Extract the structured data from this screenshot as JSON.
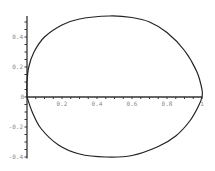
{
  "chart_data": {
    "type": "line",
    "title": "",
    "xlabel": "",
    "ylabel": "",
    "xlim": [
      0,
      1
    ],
    "ylim": [
      -0.4,
      0.54
    ],
    "grid": false,
    "legend": null,
    "x_ticks": [
      "0.2",
      "0.4",
      "0.6",
      "0.8",
      "1"
    ],
    "x_tick_values": [
      0.2,
      0.4,
      0.6,
      0.8,
      1.0
    ],
    "y_ticks": [
      "0.4",
      "0.2",
      "0",
      "-0.2",
      "-0.4"
    ],
    "y_tick_values": [
      0.4,
      0.2,
      0,
      -0.2,
      -0.4
    ],
    "series": [
      {
        "name": "closed curve",
        "color": "#222222",
        "points": [
          [
            0.0,
            0.0
          ],
          [
            0.0,
            0.1
          ],
          [
            0.01,
            0.2
          ],
          [
            0.04,
            0.3
          ],
          [
            0.1,
            0.4
          ],
          [
            0.2,
            0.48
          ],
          [
            0.3,
            0.52
          ],
          [
            0.47,
            0.54
          ],
          [
            0.6,
            0.53
          ],
          [
            0.7,
            0.5
          ],
          [
            0.8,
            0.43
          ],
          [
            0.9,
            0.31
          ],
          [
            0.97,
            0.17
          ],
          [
            1.0,
            0.05
          ],
          [
            1.0,
            0.0
          ],
          [
            0.98,
            -0.06
          ],
          [
            0.93,
            -0.16
          ],
          [
            0.85,
            -0.26
          ],
          [
            0.75,
            -0.33
          ],
          [
            0.6,
            -0.39
          ],
          [
            0.45,
            -0.4
          ],
          [
            0.3,
            -0.38
          ],
          [
            0.18,
            -0.32
          ],
          [
            0.08,
            -0.21
          ],
          [
            0.03,
            -0.1
          ],
          [
            0.0,
            0.0
          ]
        ]
      }
    ]
  },
  "axes": {
    "origin_label": "0"
  }
}
